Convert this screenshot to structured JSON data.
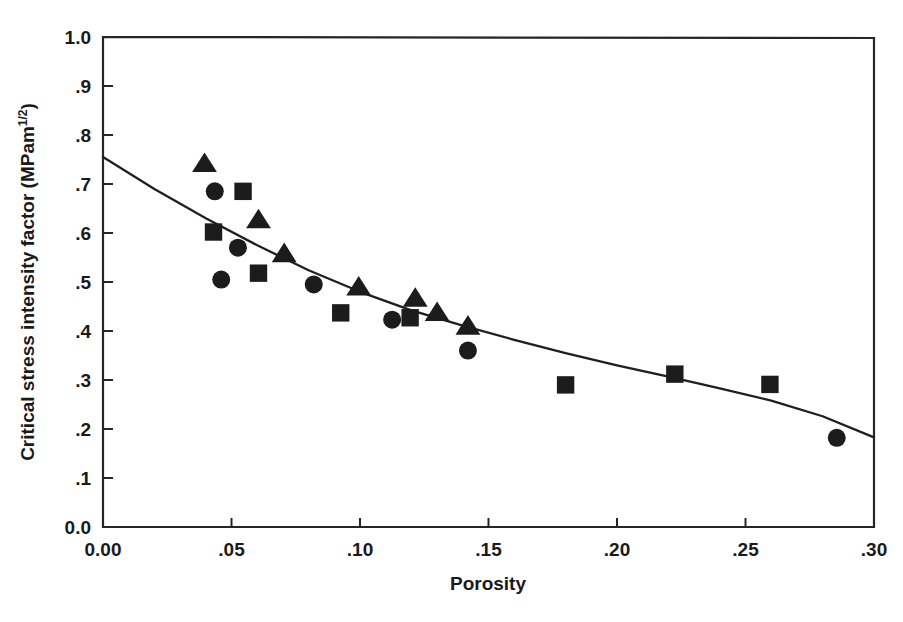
{
  "chart_data": {
    "type": "scatter",
    "title": "",
    "xlabel": "Porosity",
    "ylabel": "Critical stress intensity factor   (MPam",
    "ylabel_superscript": "1/2",
    "ylabel_suffix": ")",
    "xlim": [
      0.0,
      0.3
    ],
    "ylim": [
      0.0,
      1.0
    ],
    "grid": false,
    "legend": "none",
    "xticks": [
      0.0,
      0.05,
      0.1,
      0.15,
      0.2,
      0.25,
      0.3
    ],
    "xtick_labels": [
      "0.00",
      ".05",
      ".10",
      ".15",
      ".20",
      ".25",
      ".30"
    ],
    "yticks": [
      0.0,
      0.1,
      0.2,
      0.3,
      0.4,
      0.5,
      0.6,
      0.7,
      0.8,
      0.9,
      1.0
    ],
    "ytick_labels": [
      "0.0",
      ".1",
      ".2",
      ".3",
      ".4",
      ".5",
      ".6",
      ".7",
      ".8",
      ".9",
      "1.0"
    ],
    "marker_color": "#1c1c1c",
    "curve_color": "#1f1f1f",
    "axis_color": "#262626",
    "series": [
      {
        "name": "triangles",
        "marker": "triangle",
        "points": [
          [
            0.0395,
            0.742
          ],
          [
            0.0605,
            0.627
          ],
          [
            0.0705,
            0.558
          ],
          [
            0.0995,
            0.49
          ],
          [
            0.1215,
            0.467
          ],
          [
            0.13,
            0.438
          ],
          [
            0.142,
            0.41
          ]
        ]
      },
      {
        "name": "circles",
        "marker": "circle",
        "points": [
          [
            0.0435,
            0.685
          ],
          [
            0.0525,
            0.57
          ],
          [
            0.046,
            0.505
          ],
          [
            0.082,
            0.495
          ],
          [
            0.1125,
            0.423
          ],
          [
            0.142,
            0.36
          ],
          [
            0.2855,
            0.182
          ]
        ]
      },
      {
        "name": "squares",
        "marker": "square",
        "points": [
          [
            0.043,
            0.602
          ],
          [
            0.0545,
            0.685
          ],
          [
            0.0605,
            0.518
          ],
          [
            0.0925,
            0.437
          ],
          [
            0.1195,
            0.427
          ],
          [
            0.18,
            0.29
          ],
          [
            0.2225,
            0.312
          ],
          [
            0.2595,
            0.291
          ]
        ]
      }
    ],
    "fit_curve": {
      "name": "fitted exponential decay",
      "points": [
        [
          0.0,
          0.755
        ],
        [
          0.02,
          0.69
        ],
        [
          0.04,
          0.63
        ],
        [
          0.06,
          0.575
        ],
        [
          0.08,
          0.524
        ],
        [
          0.1,
          0.48
        ],
        [
          0.12,
          0.442
        ],
        [
          0.14,
          0.411
        ],
        [
          0.16,
          0.382
        ],
        [
          0.18,
          0.355
        ],
        [
          0.2,
          0.33
        ],
        [
          0.22,
          0.307
        ],
        [
          0.24,
          0.283
        ],
        [
          0.26,
          0.258
        ],
        [
          0.28,
          0.226
        ],
        [
          0.3,
          0.183
        ]
      ]
    }
  },
  "geometry": {
    "plot_left": 103,
    "plot_right": 874,
    "plot_top": 37,
    "plot_bottom": 527
  }
}
